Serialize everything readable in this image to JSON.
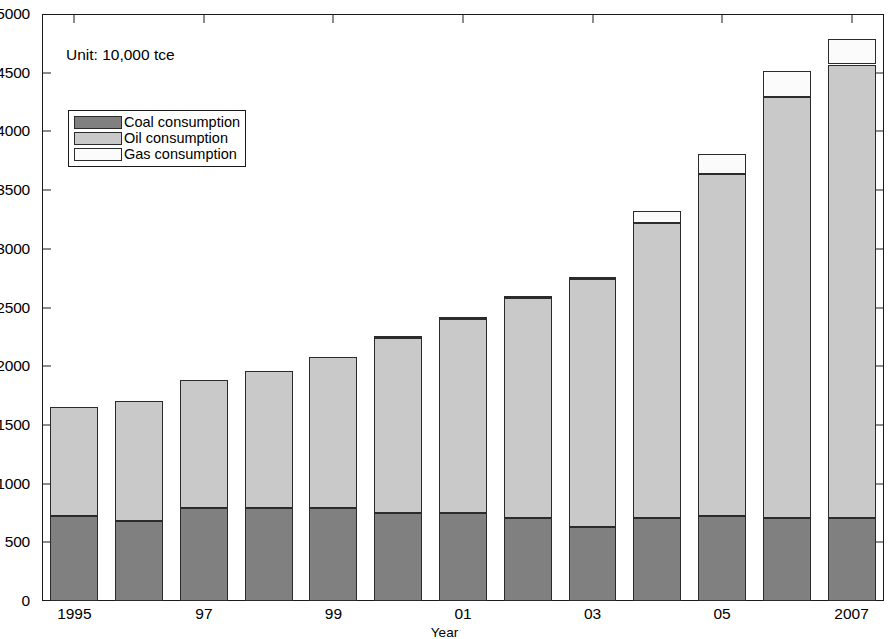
{
  "chart_data": {
    "type": "bar",
    "stacked": true,
    "title": "",
    "subtitle": "",
    "annotation": "Unit: 10,000 tce",
    "xlabel": "Year",
    "ylabel": "",
    "grid": false,
    "legend_position": "upper-left",
    "ylim": [
      0,
      5000
    ],
    "yticks": [
      0,
      500,
      1000,
      1500,
      2000,
      2500,
      3000,
      3500,
      4000,
      4500,
      5000
    ],
    "categories": [
      "1995",
      "1996",
      "1997",
      "1998",
      "1999",
      "2000",
      "2001",
      "2002",
      "2003",
      "2004",
      "2005",
      "2006",
      "2007"
    ],
    "xtick_labels": [
      "1995",
      "97",
      "99",
      "01",
      "03",
      "05",
      "2007"
    ],
    "xtick_categories": [
      "1995",
      "1997",
      "1999",
      "2001",
      "2003",
      "2005",
      "2007"
    ],
    "series": [
      {
        "name": "Coal consumption",
        "color": "#808080",
        "values": [
          720,
          680,
          790,
          795,
          790,
          750,
          750,
          710,
          630,
          710,
          720,
          705,
          710
        ]
      },
      {
        "name": "Oil consumption",
        "color": "#c9c9c9",
        "values": [
          930,
          1020,
          1090,
          1165,
          1285,
          1490,
          1650,
          1875,
          2110,
          2510,
          2920,
          3590,
          3860
        ]
      },
      {
        "name": "Gas consumption",
        "color": "#fbfbfb",
        "values": [
          0,
          0,
          0,
          0,
          0,
          10,
          10,
          10,
          10,
          100,
          170,
          220,
          220
        ]
      }
    ],
    "totals": [
      1650,
      1700,
      1880,
      1960,
      2075,
      2250,
      2410,
      2595,
      2750,
      3320,
      3810,
      4520,
      4790
    ]
  }
}
